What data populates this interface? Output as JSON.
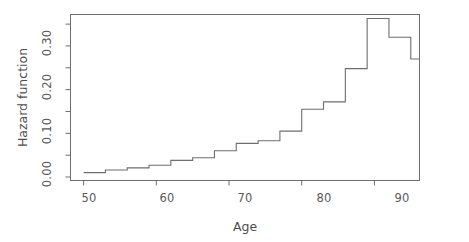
{
  "figure": {
    "background_color": "#ffffff",
    "line_color": "#6e6e6e",
    "axis_color": "#6e6e6e",
    "text_color": "#4d4d4d"
  },
  "axes": {
    "x_title": "Age",
    "y_title": "Hazard function",
    "x_tick_labels": [
      "50",
      "60",
      "70",
      "80",
      "90"
    ],
    "x_tick_values": [
      50,
      60,
      70,
      80,
      90
    ],
    "y_tick_labels": [
      "0.00",
      "0.10",
      "0.20",
      "0.30"
    ],
    "y_tick_values": [
      0.0,
      0.1,
      0.2,
      0.3
    ],
    "y_minor_tick_values": [
      0.05,
      0.15,
      0.25,
      0.35
    ]
  },
  "chart_data": {
    "type": "line",
    "subtype": "step",
    "title": "",
    "xlabel": "Age",
    "ylabel": "Hazard function",
    "xlim": [
      48.2,
      96.2
    ],
    "ylim": [
      -0.008,
      0.372
    ],
    "grid": false,
    "legend": null,
    "step_style": "post",
    "x": [
      50,
      53,
      56,
      59,
      62,
      65,
      68,
      71,
      74,
      77,
      80,
      83,
      86,
      89,
      92,
      95
    ],
    "values": [
      0.01,
      0.016,
      0.021,
      0.027,
      0.038,
      0.044,
      0.06,
      0.077,
      0.083,
      0.105,
      0.155,
      0.172,
      0.248,
      0.363,
      0.32,
      0.27
    ],
    "series": [
      {
        "name": "Hazard function",
        "values": [
          0.01,
          0.016,
          0.021,
          0.027,
          0.038,
          0.044,
          0.06,
          0.077,
          0.083,
          0.105,
          0.155,
          0.172,
          0.248,
          0.363,
          0.32,
          0.27
        ]
      }
    ],
    "annotations": []
  }
}
